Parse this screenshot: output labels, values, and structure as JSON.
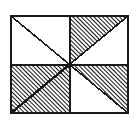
{
  "figure": {
    "type": "geometric-diagram",
    "canvas": {
      "width": 140,
      "height": 125,
      "background": "#ffffff"
    },
    "colors": {
      "stroke": "#1a1a1a",
      "hatch": "#141414",
      "fill_white": "#ffffff",
      "background": "#ffffff"
    },
    "frame": {
      "label": "outer-rectangle",
      "x": 11,
      "y": 16,
      "width": 117,
      "height": 97,
      "stroke_width": 2.2
    },
    "center": {
      "x": 69.5,
      "y": 64.5,
      "label": "center-point"
    },
    "dividers": [
      {
        "label": "vertical-divider",
        "x1": 69.5,
        "y1": 16,
        "x2": 69.5,
        "y2": 113
      },
      {
        "label": "horizontal-divider",
        "x1": 11,
        "y1": 64.5,
        "x2": 128,
        "y2": 64.5
      }
    ],
    "diagonals": [
      {
        "label": "diagonal-top-left-to-center",
        "x1": 11,
        "y1": 16,
        "x2": 69.5,
        "y2": 64.5,
        "emphasis": "thin"
      },
      {
        "label": "diagonal-top-right-to-center",
        "x1": 128,
        "y1": 16,
        "x2": 69.5,
        "y2": 64.5,
        "emphasis": "thin"
      },
      {
        "label": "diagonal-center-to-bottom-left",
        "x1": 69.5,
        "y1": 64.5,
        "x2": 11,
        "y2": 113,
        "emphasis": "thick"
      },
      {
        "label": "diagonal-center-to-bottom-right",
        "x1": 69.5,
        "y1": 64.5,
        "x2": 128,
        "y2": 113,
        "emphasis": "thin"
      }
    ],
    "hatch_pattern": {
      "label": "diagonal-hatch",
      "angle_degrees": 45,
      "direction": "lower-left-to-upper-right",
      "spacing_px": 3,
      "line_width_px": 1.5,
      "color": "#141414"
    },
    "quadrants": [
      {
        "id": "top-left",
        "label": "Top-left quadrant",
        "fill": "white",
        "hatched_region": "none",
        "description": "White square crossed by a diagonal from the top-left corner to the center."
      },
      {
        "id": "top-right",
        "label": "Top-right quadrant",
        "fill": "hatched-triangle",
        "hatched_region": "upper-left triangle above the diagonal running from the top-right corner to the center",
        "description": "Hatched triangle with vertices at center, top-left of quadrant, and top-right corner; remaining lower-right triangle is white."
      },
      {
        "id": "bottom-left",
        "label": "Bottom-left quadrant",
        "fill": "hatched-full",
        "hatched_region": "entire quadrant",
        "description": "Fully hatched square with an emphasized diagonal from the center to the bottom-left corner."
      },
      {
        "id": "bottom-right",
        "label": "Bottom-right quadrant",
        "fill": "hatched-triangle",
        "hatched_region": "upper-right triangle above the diagonal running from the center to the bottom-right corner",
        "description": "Hatched triangle with vertices at center, top-right of quadrant, and bottom-right corner; remaining lower-left triangle is white."
      }
    ]
  }
}
